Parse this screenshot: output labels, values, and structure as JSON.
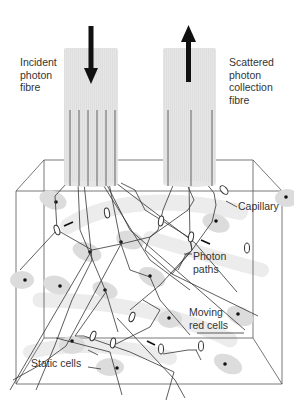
{
  "diagram": {
    "type": "schematic",
    "labels": {
      "incident_fibre": "Incident\nphoton\nfibre",
      "collection_fibre": "Scattered\nphoton\ncollection\nfibre",
      "capillary": "Capillary",
      "photon_paths": "Photon\npaths",
      "moving_red_cells": "Moving\nred cells",
      "static_cells": "Static cells"
    },
    "colors": {
      "line": "#333333",
      "arrow": "#111111",
      "fibre_fill": "#e4e4e4",
      "cell_fill": "#dcdcdc",
      "capillary_fill": "#ececec",
      "text": "#333333"
    },
    "arrows": [
      {
        "name": "incident-arrow",
        "direction": "down"
      },
      {
        "name": "collection-arrow",
        "direction": "up"
      }
    ],
    "fibres": [
      {
        "name": "incident",
        "inner_lines": 6
      },
      {
        "name": "collection",
        "inner_lines": 3
      }
    ]
  }
}
